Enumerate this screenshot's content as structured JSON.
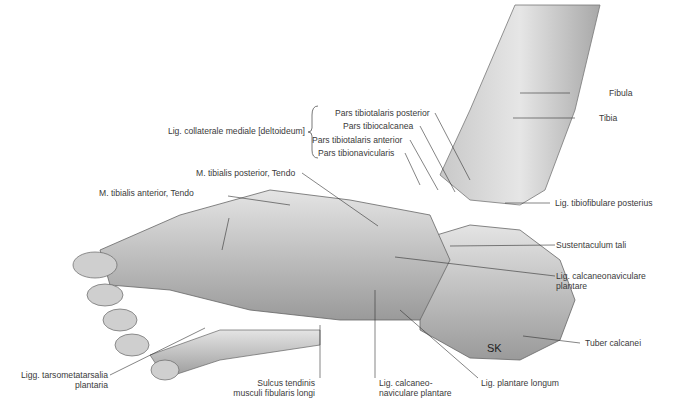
{
  "figure": {
    "signature": "SK",
    "colors": {
      "background": "#ffffff",
      "label_text": "#3a3a3a",
      "leader_line": "#333333",
      "bone_light": "#d9d9d9",
      "bone_dark": "#8a8a8a"
    }
  },
  "labels": {
    "lig_collaterale": "Lig. collaterale mediale [deltoideum]",
    "pars_tibiotalaris_post": "Pars tibiotalaris posterior",
    "pars_tibiocalcanea": "Pars tibiocalcanea",
    "pars_tibiotalaris_ant": "Pars tibiotalaris anterior",
    "pars_tibionavicularis": "Pars tibionavicularis",
    "m_tib_post": "M. tibialis posterior, Tendo",
    "m_tib_ant": "M. tibialis anterior, Tendo",
    "fibula": "Fibula",
    "tibia": "Tibia",
    "lig_tibiofib_post": "Lig. tibiofibulare posterius",
    "sustentaculum": "Sustentaculum tali",
    "lig_calcnav_plant_1": "Lig. calcaneonaviculare",
    "lig_calcnav_plant_2": "plantare",
    "tuber": "Tuber calcanei",
    "ligg_tarso_1": "Ligg. tarsometatarsalia",
    "ligg_tarso_2": "plantaria",
    "sulcus_1": "Sulcus tendinis",
    "sulcus_2": "musculi fibularis longi",
    "lig_calcaneo_1": "Lig. calcaneo-",
    "lig_calcaneo_2": "naviculare plantare",
    "lig_plantare_longum": "Lig. plantare longum"
  }
}
